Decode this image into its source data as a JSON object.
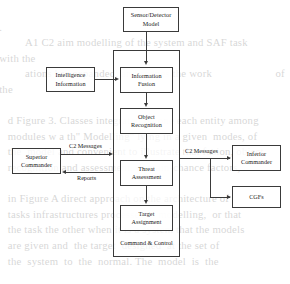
{
  "diagram": {
    "container": {
      "label": "Command & Control"
    },
    "nodes": [
      {
        "id": "sensor",
        "label": "Sensor/Detector\nModel"
      },
      {
        "id": "intel",
        "label": "Intelligence\nInformation"
      },
      {
        "id": "fusion",
        "label": "Information\nFusion"
      },
      {
        "id": "object",
        "label": "Object\nRecognition"
      },
      {
        "id": "threat",
        "label": "Threat\nAssessment"
      },
      {
        "id": "target",
        "label": "Target\nAssignment"
      },
      {
        "id": "superior",
        "label": "Superior\nCommander"
      },
      {
        "id": "inferior",
        "label": "Inferior\nCommander"
      },
      {
        "id": "cgfs",
        "label": "CGFs"
      }
    ],
    "node_labels": {
      "sensor_line1": "Sensor/Detector",
      "sensor_line2": "Model",
      "intel_line1": "Intelligence",
      "intel_line2": "Information",
      "fusion_line1": "Information",
      "fusion_line2": "Fusion",
      "object_line1": "Object",
      "object_line2": "Recognition",
      "threat_line1": "Threat",
      "threat_line2": "Assessment",
      "target_line1": "Target",
      "target_line2": "Assignment",
      "superior_line1": "Superior",
      "superior_line2": "Commander",
      "inferior_line1": "Inferior",
      "inferior_line2": "Commander",
      "cgfs_line1": "CGFs"
    },
    "edge_labels": {
      "c2_messages_left": "C2 Messages",
      "reports": "Reports",
      "c2_messages_right": "C2 Messages"
    },
    "colors": {
      "stroke": "#3a3a3a",
      "text": "#1a1a1a",
      "background": "#ffffff"
    }
  },
  "page_bleed": {
    "text": "                                                                                                                                            .                       \n         A1 C2 aim modelling of the system and SAF task                    with the\n         ations has expanded, and scopes the work                      of the\n\n   d Figure 3. Classes integrated on one each entity among\n   modules w a th\" Modelling\" lying in a given  modes, of\n   the  model and convenient to illustrate that fusion, object\n   recognition and assessment, domain-chance factors,\n\n   in Figure A direct approach on the architecture of\n   tasks infrastructures processes in modelling,  or that\n   the task the other when it is a system that the models\n   are given and  the target  designed  at the set of\n   the  system  to  the  normal. The  model  is  the\n\n   connections  are  also  a  subsystem  of  the  architecture.\n   Moreover, C2 model is a reference to many in\n   the control aspects and C2 for implementation tasks. In\n   the ap-proach  it  contains  the  system  of  systems\n   shows the structural assessment and the control  of\n   the C2 structure of the modelling."
  }
}
